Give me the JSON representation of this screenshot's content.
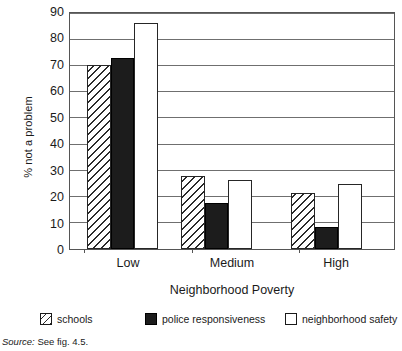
{
  "chart_data": {
    "type": "bar",
    "title": "",
    "xlabel": "Neighborhood Poverty",
    "ylabel": "% not a problem",
    "categories": [
      "Low",
      "Medium",
      "High"
    ],
    "ylim": [
      0,
      90
    ],
    "ytick_step": 10,
    "yticks": [
      "90",
      "80",
      "70",
      "60",
      "50",
      "40",
      "30",
      "20",
      "10",
      "0"
    ],
    "grid": true,
    "legend_position": "bottom",
    "series": [
      {
        "name": "schools",
        "fill": "hatched",
        "color": "#ffffff",
        "values": [
          70.5,
          28.0,
          21.5
        ]
      },
      {
        "name": "police responsiveness",
        "fill": "solid",
        "color": "#1c1c1c",
        "values": [
          73.0,
          17.8,
          8.5
        ]
      },
      {
        "name": "neighborhood safety",
        "fill": "empty",
        "color": "#ffffff",
        "values": [
          86.5,
          26.5,
          25.0
        ]
      }
    ]
  },
  "source_note": {
    "prefix": "Source:",
    "text": "See fig. 4.5."
  }
}
